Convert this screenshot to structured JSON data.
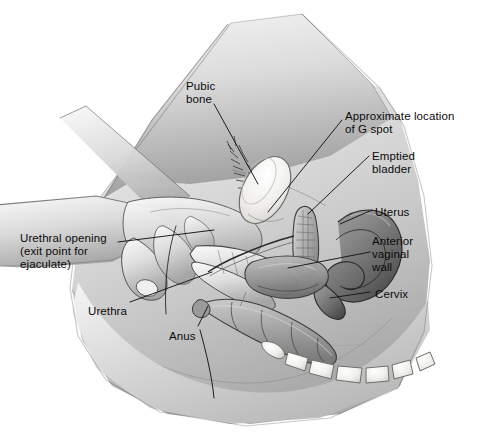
{
  "figure": {
    "style": "grayscale medical line-and-tone illustration",
    "background_color": "#ffffff",
    "skin_tone_color": "#cfcfcf",
    "ink_color": "#1a1a1a",
    "bone_color": "#f2f2f0",
    "organ_color": "#8c8c8c"
  },
  "labels": [
    {
      "id": "pubic-bone",
      "text": "Pubic\nbone",
      "x": 186,
      "y": 80,
      "align": "left"
    },
    {
      "id": "g-spot",
      "text": "Approximate location\nof G spot",
      "x": 345,
      "y": 110,
      "align": "left"
    },
    {
      "id": "bladder",
      "text": "Emptied\nbladder",
      "x": 372,
      "y": 150,
      "align": "left"
    },
    {
      "id": "uterus",
      "text": "Uterus",
      "x": 375,
      "y": 206,
      "align": "left"
    },
    {
      "id": "vaginal-wall",
      "text": "Anterior\nvaginal\nwall",
      "x": 372,
      "y": 235,
      "align": "left"
    },
    {
      "id": "cervix",
      "text": "Cervix",
      "x": 375,
      "y": 288,
      "align": "left"
    },
    {
      "id": "urethral-opening",
      "text": "Urethral opening\n(exit point for\nejaculate)",
      "x": 20,
      "y": 232,
      "align": "left"
    },
    {
      "id": "urethra",
      "text": "Urethra",
      "x": 88,
      "y": 305,
      "align": "left"
    },
    {
      "id": "anus",
      "text": "Anus",
      "x": 169,
      "y": 330,
      "align": "left"
    }
  ],
  "structures": [
    {
      "id": "pubic-bone",
      "name": "pubic bone",
      "kind": "bone"
    },
    {
      "id": "bladder",
      "name": "emptied bladder",
      "kind": "organ"
    },
    {
      "id": "uterus",
      "name": "uterus",
      "kind": "organ"
    },
    {
      "id": "vagina",
      "name": "vaginal canal",
      "kind": "organ"
    },
    {
      "id": "cervix",
      "name": "cervix",
      "kind": "organ"
    },
    {
      "id": "rectum",
      "name": "rectum",
      "kind": "organ"
    },
    {
      "id": "urethra",
      "name": "urethra",
      "kind": "organ"
    },
    {
      "id": "sacrum",
      "name": "sacrum / coccyx vertebrae",
      "kind": "bone"
    },
    {
      "id": "hand",
      "name": "hand with inserted fingers",
      "kind": "body"
    },
    {
      "id": "pubic-hair",
      "name": "pubic hair",
      "kind": "body"
    }
  ]
}
